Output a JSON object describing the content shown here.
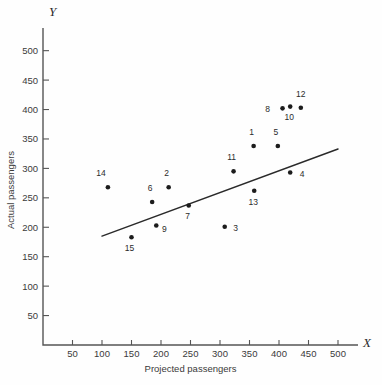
{
  "chart_data": {
    "type": "scatter",
    "title": "",
    "xlabel": "Projected passengers",
    "ylabel": "Actual passengers",
    "x_axis_letter": "X",
    "y_axis_letter": "Y",
    "xlim": [
      0,
      530
    ],
    "ylim": [
      0,
      530
    ],
    "xticks": [
      50,
      100,
      150,
      200,
      250,
      300,
      350,
      400,
      450,
      500
    ],
    "yticks": [
      50,
      100,
      150,
      200,
      250,
      300,
      350,
      400,
      450,
      500
    ],
    "grid": false,
    "legend": "none",
    "points": [
      {
        "label": "14",
        "x": 110,
        "y": 268,
        "lx": -7,
        "ly": -11
      },
      {
        "label": "15",
        "x": 150,
        "y": 183,
        "lx": -2,
        "ly": 14
      },
      {
        "label": "9",
        "x": 192,
        "y": 203,
        "lx": 8,
        "ly": 7
      },
      {
        "label": "6",
        "x": 185,
        "y": 243,
        "lx": -2,
        "ly": -11
      },
      {
        "label": "2",
        "x": 213,
        "y": 268,
        "lx": -2,
        "ly": -11
      },
      {
        "label": "7",
        "x": 247,
        "y": 237,
        "lx": -1,
        "ly": 14
      },
      {
        "label": "3",
        "x": 308,
        "y": 201,
        "lx": 11,
        "ly": 4
      },
      {
        "label": "11",
        "x": 323,
        "y": 295,
        "lx": -2,
        "ly": -11
      },
      {
        "label": "13",
        "x": 358,
        "y": 262,
        "lx": -1,
        "ly": 14
      },
      {
        "label": "1",
        "x": 357,
        "y": 338,
        "lx": -2,
        "ly": -11
      },
      {
        "label": "5",
        "x": 398,
        "y": 338,
        "lx": -2,
        "ly": -11
      },
      {
        "label": "8",
        "x": 406,
        "y": 402,
        "lx": -15,
        "ly": 4
      },
      {
        "label": "10",
        "x": 419,
        "y": 405,
        "lx": -1,
        "ly": 13
      },
      {
        "label": "12",
        "x": 437,
        "y": 403,
        "lx": 0,
        "ly": -11
      },
      {
        "label": "4",
        "x": 419,
        "y": 293,
        "lx": 12,
        "ly": 4
      }
    ],
    "fit_line": {
      "name": "regression-line",
      "x1": 100,
      "y1": 185,
      "x2": 500,
      "y2": 333
    }
  }
}
